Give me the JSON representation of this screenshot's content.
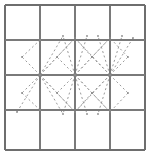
{
  "figure": {
    "title": "",
    "type": "geometric-lattice-diagram",
    "canvas": {
      "width": 150,
      "height": 158
    },
    "colors": {
      "background": "#ffffff",
      "grid_line": "#7a7a7a",
      "border_line": "#6e6e6e",
      "pattern_line": "#9a9a9a",
      "node": "#8a8a8a"
    },
    "grid": {
      "rows": 4,
      "columns": 4,
      "x_lines": [
        5,
        40,
        75,
        110,
        145
      ],
      "y_lines": [
        5,
        40,
        75,
        110,
        150
      ],
      "cell_width": 35,
      "cell_height": 35,
      "stroke_width": 1.2,
      "border_stroke_width": 1.6
    },
    "pattern": {
      "style": "dashed",
      "dash_pattern": "2,2.6",
      "stroke_width": 1.0,
      "hubs": [
        {
          "name": "hub-left",
          "x": 40,
          "y": 75
        },
        {
          "name": "hub-center",
          "x": 75,
          "y": 75
        },
        {
          "name": "hub-right",
          "x": 110,
          "y": 75
        }
      ],
      "nodes": [
        {
          "x": 40,
          "y": 75
        },
        {
          "x": 75,
          "y": 75
        },
        {
          "x": 110,
          "y": 75
        },
        {
          "x": 75,
          "y": 38
        },
        {
          "x": 110,
          "y": 38
        },
        {
          "x": 75,
          "y": 112
        },
        {
          "x": 110,
          "y": 112
        },
        {
          "x": 57,
          "y": 57
        },
        {
          "x": 92,
          "y": 57
        },
        {
          "x": 57,
          "y": 93
        },
        {
          "x": 92,
          "y": 93
        },
        {
          "x": 22,
          "y": 57
        },
        {
          "x": 128,
          "y": 57
        },
        {
          "x": 22,
          "y": 93
        },
        {
          "x": 128,
          "y": 93
        },
        {
          "x": 63,
          "y": 36
        },
        {
          "x": 87,
          "y": 36
        },
        {
          "x": 63,
          "y": 114
        },
        {
          "x": 87,
          "y": 114
        },
        {
          "x": 98,
          "y": 36
        },
        {
          "x": 122,
          "y": 36
        },
        {
          "x": 98,
          "y": 114
        },
        {
          "x": 133,
          "y": 38
        },
        {
          "x": 17,
          "y": 112
        },
        {
          "x": 40,
          "y": 40
        },
        {
          "x": 40,
          "y": 110
        },
        {
          "x": 110,
          "y": 110
        }
      ],
      "edges": [
        {
          "from": [
            40,
            75
          ],
          "to": [
            75,
            38
          ]
        },
        {
          "from": [
            40,
            75
          ],
          "to": [
            75,
            75
          ]
        },
        {
          "from": [
            40,
            75
          ],
          "to": [
            75,
            112
          ]
        },
        {
          "from": [
            40,
            75
          ],
          "to": [
            57,
            57
          ]
        },
        {
          "from": [
            40,
            75
          ],
          "to": [
            57,
            93
          ]
        },
        {
          "from": [
            40,
            75
          ],
          "to": [
            22,
            57
          ]
        },
        {
          "from": [
            40,
            75
          ],
          "to": [
            22,
            93
          ]
        },
        {
          "from": [
            40,
            75
          ],
          "to": [
            17,
            112
          ]
        },
        {
          "from": [
            40,
            75
          ],
          "to": [
            63,
            36
          ]
        },
        {
          "from": [
            40,
            75
          ],
          "to": [
            63,
            114
          ]
        },
        {
          "from": [
            75,
            75
          ],
          "to": [
            75,
            38
          ]
        },
        {
          "from": [
            75,
            75
          ],
          "to": [
            75,
            112
          ]
        },
        {
          "from": [
            75,
            75
          ],
          "to": [
            110,
            75
          ]
        },
        {
          "from": [
            75,
            75
          ],
          "to": [
            92,
            57
          ]
        },
        {
          "from": [
            75,
            75
          ],
          "to": [
            92,
            93
          ]
        },
        {
          "from": [
            75,
            75
          ],
          "to": [
            57,
            57
          ]
        },
        {
          "from": [
            75,
            75
          ],
          "to": [
            57,
            93
          ]
        },
        {
          "from": [
            75,
            75
          ],
          "to": [
            110,
            38
          ]
        },
        {
          "from": [
            75,
            75
          ],
          "to": [
            110,
            112
          ]
        },
        {
          "from": [
            75,
            75
          ],
          "to": [
            63,
            36
          ]
        },
        {
          "from": [
            75,
            75
          ],
          "to": [
            87,
            36
          ]
        },
        {
          "from": [
            75,
            75
          ],
          "to": [
            63,
            114
          ]
        },
        {
          "from": [
            75,
            75
          ],
          "to": [
            87,
            114
          ]
        },
        {
          "from": [
            110,
            75
          ],
          "to": [
            110,
            38
          ]
        },
        {
          "from": [
            110,
            75
          ],
          "to": [
            110,
            112
          ]
        },
        {
          "from": [
            110,
            75
          ],
          "to": [
            128,
            57
          ]
        },
        {
          "from": [
            110,
            75
          ],
          "to": [
            128,
            93
          ]
        },
        {
          "from": [
            110,
            75
          ],
          "to": [
            92,
            57
          ]
        },
        {
          "from": [
            110,
            75
          ],
          "to": [
            92,
            93
          ]
        },
        {
          "from": [
            110,
            75
          ],
          "to": [
            98,
            36
          ]
        },
        {
          "from": [
            110,
            75
          ],
          "to": [
            98,
            114
          ]
        },
        {
          "from": [
            110,
            75
          ],
          "to": [
            122,
            36
          ]
        },
        {
          "from": [
            110,
            75
          ],
          "to": [
            133,
            38
          ]
        },
        {
          "from": [
            110,
            75
          ],
          "to": [
            75,
            38
          ]
        },
        {
          "from": [
            110,
            75
          ],
          "to": [
            75,
            112
          ]
        },
        {
          "from": [
            22,
            57
          ],
          "to": [
            40,
            40
          ]
        },
        {
          "from": [
            22,
            93
          ],
          "to": [
            40,
            110
          ]
        },
        {
          "from": [
            57,
            57
          ],
          "to": [
            75,
            38
          ]
        },
        {
          "from": [
            92,
            57
          ],
          "to": [
            75,
            38
          ]
        },
        {
          "from": [
            57,
            93
          ],
          "to": [
            75,
            112
          ]
        },
        {
          "from": [
            92,
            93
          ],
          "to": [
            75,
            112
          ]
        },
        {
          "from": [
            92,
            57
          ],
          "to": [
            110,
            38
          ]
        },
        {
          "from": [
            92,
            93
          ],
          "to": [
            110,
            112
          ]
        },
        {
          "from": [
            128,
            57
          ],
          "to": [
            110,
            38
          ]
        },
        {
          "from": [
            128,
            93
          ],
          "to": [
            110,
            112
          ]
        }
      ]
    }
  }
}
